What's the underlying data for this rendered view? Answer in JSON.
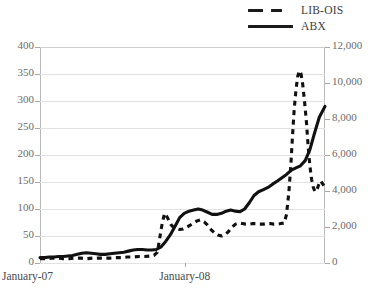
{
  "chart_data": {
    "type": "line",
    "title": "",
    "xlabel": "",
    "ylabel": "",
    "grid": true,
    "legend_position": "top-right",
    "x_tick_labels": [
      "January-07",
      "January-08"
    ],
    "x_tick_positions": [
      0,
      0.508
    ],
    "axes": {
      "left": {
        "label": "",
        "min": 0,
        "max": 400,
        "step": 50,
        "tick_labels": [
          "0",
          "50",
          "100",
          "150",
          "200",
          "250",
          "300",
          "350",
          "400"
        ]
      },
      "right": {
        "label": "",
        "min": 0,
        "max": 12000,
        "step": 2000,
        "tick_labels": [
          "0",
          "2,000",
          "4,000",
          "6,000",
          "8,000",
          "10,000",
          "12,000"
        ]
      }
    },
    "series": [
      {
        "name": "LIB-OIS",
        "axis": "left",
        "style": "dashed",
        "color": "#111111",
        "x": [
          0.0,
          0.02,
          0.041,
          0.061,
          0.082,
          0.102,
          0.122,
          0.143,
          0.163,
          0.184,
          0.204,
          0.224,
          0.245,
          0.265,
          0.286,
          0.306,
          0.326,
          0.347,
          0.367,
          0.388,
          0.4,
          0.412,
          0.42,
          0.429,
          0.437,
          0.445,
          0.453,
          0.461,
          0.469,
          0.478,
          0.49,
          0.502,
          0.514,
          0.527,
          0.539,
          0.551,
          0.563,
          0.576,
          0.588,
          0.6,
          0.612,
          0.624,
          0.637,
          0.649,
          0.661,
          0.673,
          0.686,
          0.698,
          0.71,
          0.722,
          0.735,
          0.747,
          0.759,
          0.771,
          0.784,
          0.796,
          0.808,
          0.82,
          0.833,
          0.845,
          0.857,
          0.865,
          0.873,
          0.88,
          0.886,
          0.892,
          0.898,
          0.904,
          0.91,
          0.916,
          0.922,
          0.928,
          0.935,
          0.941,
          0.947,
          0.953,
          0.959,
          0.965,
          0.971,
          0.978,
          0.984,
          0.99,
          1.0
        ],
        "y": [
          8,
          8,
          9,
          9,
          8,
          8,
          9,
          9,
          8,
          9,
          9,
          9,
          9,
          10,
          10,
          11,
          11,
          12,
          12,
          13,
          14,
          20,
          46,
          74,
          92,
          86,
          78,
          70,
          66,
          64,
          62,
          63,
          66,
          70,
          74,
          78,
          80,
          76,
          70,
          62,
          56,
          52,
          50,
          52,
          58,
          66,
          72,
          74,
          73,
          72,
          72,
          73,
          73,
          72,
          72,
          73,
          73,
          72,
          72,
          73,
          74,
          90,
          130,
          180,
          235,
          285,
          320,
          345,
          356,
          350,
          330,
          300,
          260,
          215,
          180,
          155,
          140,
          132,
          135,
          145,
          152,
          148,
          140
        ]
      },
      {
        "name": "ABX",
        "axis": "left",
        "style": "solid",
        "color": "#111111",
        "x": [
          0.0,
          0.016,
          0.033,
          0.049,
          0.065,
          0.082,
          0.098,
          0.114,
          0.131,
          0.147,
          0.163,
          0.18,
          0.196,
          0.212,
          0.229,
          0.245,
          0.261,
          0.278,
          0.294,
          0.31,
          0.327,
          0.343,
          0.359,
          0.376,
          0.392,
          0.408,
          0.425,
          0.441,
          0.457,
          0.474,
          0.49,
          0.506,
          0.523,
          0.539,
          0.555,
          0.571,
          0.588,
          0.604,
          0.62,
          0.637,
          0.653,
          0.669,
          0.686,
          0.702,
          0.718,
          0.735,
          0.751,
          0.767,
          0.784,
          0.8,
          0.816,
          0.833,
          0.849,
          0.865,
          0.882,
          0.898,
          0.914,
          0.931,
          0.947,
          0.963,
          0.98,
          1.0
        ],
        "y": [
          10,
          10,
          11,
          11,
          12,
          12,
          13,
          14,
          16,
          18,
          19,
          18,
          17,
          16,
          16,
          17,
          18,
          19,
          20,
          22,
          24,
          25,
          25,
          24,
          24,
          25,
          30,
          40,
          52,
          68,
          84,
          92,
          96,
          98,
          100,
          98,
          94,
          90,
          90,
          92,
          96,
          98,
          96,
          95,
          100,
          112,
          125,
          132,
          136,
          140,
          146,
          152,
          158,
          164,
          172,
          176,
          180,
          190,
          210,
          240,
          270,
          290
        ]
      }
    ]
  },
  "legend": {
    "items": [
      {
        "label": "LIB-OIS",
        "style": "dashed"
      },
      {
        "label": "ABX",
        "style": "solid"
      }
    ]
  }
}
